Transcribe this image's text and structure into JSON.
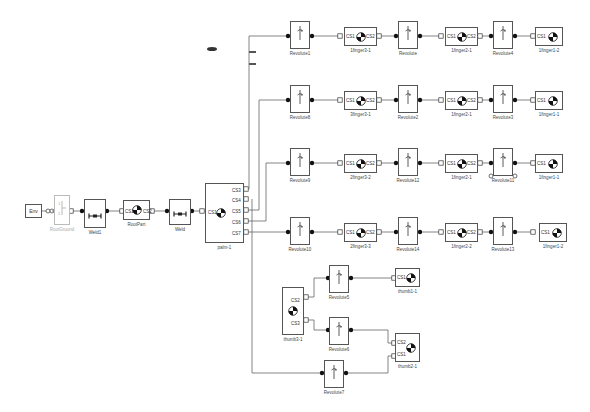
{
  "diagram": {
    "type": "simulink-simmechanics-model",
    "source_chain": {
      "env": "Env",
      "machine_config": "RootGround",
      "weld1": "Weld1",
      "root_part": "RootPart",
      "weld2": "Weld",
      "palm": "palm-1",
      "root_part_ports": [
        "CS1",
        "CS2"
      ],
      "palm_ports_left": [
        "CS1"
      ],
      "palm_ports_right": [
        "CS3",
        "CS4",
        "CS5",
        "CS6",
        "CS7"
      ]
    },
    "finger_rows": [
      {
        "from_port": "CS3",
        "blocks": [
          "Revolute1",
          "1finger3-1",
          "Revolute",
          "1finger2-1",
          "Revolute4",
          "1finger1-2"
        ]
      },
      {
        "from_port": "CS5",
        "blocks": [
          "Revolute8",
          "3finger3-1",
          "Revolute2",
          "1finger2-1",
          "Revolute3",
          "1finger1-1"
        ]
      },
      {
        "from_port": "CS6",
        "blocks": [
          "Revolute9",
          "2finger3-2",
          "Revolute12",
          "1finger2-1",
          "Revolute11",
          "1finger1-1"
        ]
      },
      {
        "from_port": "CS7",
        "blocks": [
          "Revolute10",
          "2finger3-3",
          "Revolute14",
          "1finger2-2",
          "Revolute13",
          "1finger1-2"
        ]
      }
    ],
    "thumb": {
      "from_port": "CS4",
      "base": "thumb3-1",
      "base_ports": [
        "CS2",
        "CS3"
      ],
      "joints": [
        "Revolute5",
        "Revolute6",
        "Revolute7"
      ],
      "tips": [
        "thumb1-1",
        "thumb2-1"
      ],
      "tip2_ports": [
        "CS2",
        "CS1"
      ]
    },
    "port_labels": {
      "cs1": "CS1",
      "cs2": "CS2",
      "cs3": "CS3",
      "b": "B",
      "f": "F"
    }
  }
}
